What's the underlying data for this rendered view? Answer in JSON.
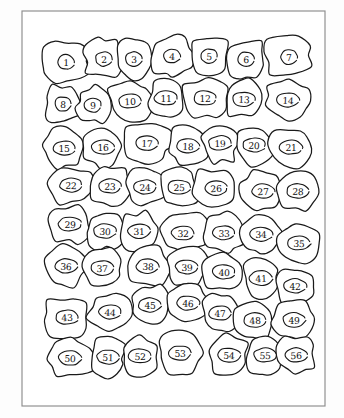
{
  "figure": {
    "kind": "hand-drawn-cell-map",
    "background_color": "#fdfdfd",
    "ink_color": "#1a1a1a",
    "frame_color": "#8d8d8d",
    "rows": 8,
    "columns": 7,
    "cell_count": 56,
    "frame": {
      "x": 22,
      "y": 11,
      "width": 303,
      "height": 395
    }
  },
  "chart_data": {
    "type": "diagram",
    "rows": [
      {
        "row": 1,
        "labels": [
          "1",
          "2",
          "3",
          "4",
          "5",
          "6",
          "7"
        ]
      },
      {
        "row": 2,
        "labels": [
          "8",
          "9",
          "10",
          "11",
          "12",
          "13",
          "14"
        ]
      },
      {
        "row": 3,
        "labels": [
          "15",
          "16",
          "17",
          "18",
          "19",
          "20",
          "21"
        ]
      },
      {
        "row": 4,
        "labels": [
          "22",
          "23",
          "24",
          "25",
          "26",
          "27",
          "28"
        ]
      },
      {
        "row": 5,
        "labels": [
          "29",
          "30",
          "31",
          "32",
          "33",
          "34",
          "35"
        ]
      },
      {
        "row": 6,
        "labels": [
          "36",
          "37",
          "38",
          "39",
          "40",
          "41",
          "42"
        ]
      },
      {
        "row": 7,
        "labels": [
          "43",
          "44",
          "45",
          "46",
          "47",
          "48",
          "49"
        ]
      },
      {
        "row": 8,
        "labels": [
          "50",
          "51",
          "52",
          "53",
          "54",
          "55",
          "56"
        ]
      }
    ]
  },
  "cells": [
    {
      "label": "1",
      "cx": 66,
      "cy": 62,
      "rx": 27,
      "ry": 23,
      "seed": 11
    },
    {
      "label": "2",
      "cx": 104,
      "cy": 59,
      "rx": 22,
      "ry": 22,
      "seed": 23
    },
    {
      "label": "3",
      "cx": 134,
      "cy": 59,
      "rx": 19,
      "ry": 22,
      "seed": 37
    },
    {
      "label": "4",
      "cx": 172,
      "cy": 56,
      "rx": 24,
      "ry": 22,
      "seed": 41
    },
    {
      "label": "5",
      "cx": 209,
      "cy": 56,
      "rx": 22,
      "ry": 22,
      "seed": 53
    },
    {
      "label": "6",
      "cx": 246,
      "cy": 59,
      "rx": 22,
      "ry": 22,
      "seed": 67
    },
    {
      "label": "7",
      "cx": 289,
      "cy": 57,
      "rx": 27,
      "ry": 23,
      "seed": 71
    },
    {
      "label": "8",
      "cx": 63,
      "cy": 104,
      "rx": 21,
      "ry": 21,
      "seed": 13
    },
    {
      "label": "9",
      "cx": 93,
      "cy": 105,
      "rx": 18,
      "ry": 21,
      "seed": 29
    },
    {
      "label": "10",
      "cx": 130,
      "cy": 101,
      "rx": 24,
      "ry": 22,
      "seed": 43
    },
    {
      "label": "11",
      "cx": 166,
      "cy": 98,
      "rx": 19,
      "ry": 21,
      "seed": 59
    },
    {
      "label": "12",
      "cx": 205,
      "cy": 98,
      "rx": 25,
      "ry": 22,
      "seed": 73
    },
    {
      "label": "13",
      "cx": 244,
      "cy": 99,
      "rx": 20,
      "ry": 21,
      "seed": 83
    },
    {
      "label": "14",
      "cx": 288,
      "cy": 100,
      "rx": 25,
      "ry": 22,
      "seed": 97
    },
    {
      "label": "15",
      "cx": 64,
      "cy": 148,
      "rx": 23,
      "ry": 22,
      "seed": 17
    },
    {
      "label": "16",
      "cx": 103,
      "cy": 147,
      "rx": 22,
      "ry": 22,
      "seed": 31
    },
    {
      "label": "17",
      "cx": 147,
      "cy": 143,
      "rx": 27,
      "ry": 23,
      "seed": 47
    },
    {
      "label": "18",
      "cx": 188,
      "cy": 146,
      "rx": 21,
      "ry": 22,
      "seed": 61
    },
    {
      "label": "19",
      "cx": 220,
      "cy": 143,
      "rx": 20,
      "ry": 22,
      "seed": 79
    },
    {
      "label": "20",
      "cx": 254,
      "cy": 145,
      "rx": 22,
      "ry": 22,
      "seed": 89
    },
    {
      "label": "21",
      "cx": 291,
      "cy": 147,
      "rx": 24,
      "ry": 22,
      "seed": 101
    },
    {
      "label": "22",
      "cx": 71,
      "cy": 185,
      "rx": 24,
      "ry": 21,
      "seed": 19
    },
    {
      "label": "23",
      "cx": 110,
      "cy": 186,
      "rx": 23,
      "ry": 22,
      "seed": 103
    },
    {
      "label": "24",
      "cx": 145,
      "cy": 187,
      "rx": 21,
      "ry": 21,
      "seed": 107
    },
    {
      "label": "25",
      "cx": 179,
      "cy": 187,
      "rx": 21,
      "ry": 21,
      "seed": 109
    },
    {
      "label": "26",
      "cx": 216,
      "cy": 188,
      "rx": 25,
      "ry": 22,
      "seed": 113
    },
    {
      "label": "27",
      "cx": 263,
      "cy": 191,
      "rx": 24,
      "ry": 22,
      "seed": 127
    },
    {
      "label": "28",
      "cx": 298,
      "cy": 191,
      "rx": 21,
      "ry": 22,
      "seed": 131
    },
    {
      "label": "29",
      "cx": 70,
      "cy": 224,
      "rx": 23,
      "ry": 21,
      "seed": 137
    },
    {
      "label": "30",
      "cx": 105,
      "cy": 231,
      "rx": 21,
      "ry": 21,
      "seed": 139
    },
    {
      "label": "31",
      "cx": 139,
      "cy": 231,
      "rx": 20,
      "ry": 21,
      "seed": 149
    },
    {
      "label": "32",
      "cx": 183,
      "cy": 233,
      "rx": 27,
      "ry": 23,
      "seed": 151
    },
    {
      "label": "33",
      "cx": 224,
      "cy": 233,
      "rx": 21,
      "ry": 22,
      "seed": 157
    },
    {
      "label": "34",
      "cx": 261,
      "cy": 234,
      "rx": 22,
      "ry": 22,
      "seed": 163
    },
    {
      "label": "35",
      "cx": 299,
      "cy": 243,
      "rx": 22,
      "ry": 22,
      "seed": 167
    },
    {
      "label": "36",
      "cx": 66,
      "cy": 266,
      "rx": 23,
      "ry": 22,
      "seed": 173
    },
    {
      "label": "37",
      "cx": 102,
      "cy": 268,
      "rx": 22,
      "ry": 22,
      "seed": 179
    },
    {
      "label": "38",
      "cx": 148,
      "cy": 266,
      "rx": 25,
      "ry": 22,
      "seed": 181
    },
    {
      "label": "39",
      "cx": 187,
      "cy": 267,
      "rx": 22,
      "ry": 22,
      "seed": 191
    },
    {
      "label": "40",
      "cx": 224,
      "cy": 272,
      "rx": 23,
      "ry": 22,
      "seed": 193
    },
    {
      "label": "41",
      "cx": 261,
      "cy": 278,
      "rx": 20,
      "ry": 21,
      "seed": 197
    },
    {
      "label": "42",
      "cx": 295,
      "cy": 286,
      "rx": 21,
      "ry": 21,
      "seed": 199
    },
    {
      "label": "43",
      "cx": 67,
      "cy": 317,
      "rx": 25,
      "ry": 23,
      "seed": 211
    },
    {
      "label": "44",
      "cx": 110,
      "cy": 312,
      "rx": 24,
      "ry": 22,
      "seed": 223
    },
    {
      "label": "45",
      "cx": 150,
      "cy": 305,
      "rx": 21,
      "ry": 22,
      "seed": 227
    },
    {
      "label": "46",
      "cx": 188,
      "cy": 303,
      "rx": 22,
      "ry": 22,
      "seed": 229
    },
    {
      "label": "47",
      "cx": 220,
      "cy": 313,
      "rx": 21,
      "ry": 21,
      "seed": 233
    },
    {
      "label": "48",
      "cx": 255,
      "cy": 320,
      "rx": 22,
      "ry": 22,
      "seed": 239
    },
    {
      "label": "49",
      "cx": 294,
      "cy": 320,
      "rx": 23,
      "ry": 22,
      "seed": 241
    },
    {
      "label": "50",
      "cx": 70,
      "cy": 358,
      "rx": 26,
      "ry": 23,
      "seed": 251
    },
    {
      "label": "51",
      "cx": 108,
      "cy": 357,
      "rx": 19,
      "ry": 22,
      "seed": 257
    },
    {
      "label": "52",
      "cx": 140,
      "cy": 356,
      "rx": 20,
      "ry": 22,
      "seed": 263
    },
    {
      "label": "53",
      "cx": 180,
      "cy": 353,
      "rx": 26,
      "ry": 23,
      "seed": 269
    },
    {
      "label": "54",
      "cx": 229,
      "cy": 355,
      "rx": 22,
      "ry": 22,
      "seed": 271
    },
    {
      "label": "55",
      "cx": 265,
      "cy": 355,
      "rx": 19,
      "ry": 22,
      "seed": 277
    },
    {
      "label": "56",
      "cx": 296,
      "cy": 355,
      "rx": 21,
      "ry": 22,
      "seed": 281
    }
  ]
}
